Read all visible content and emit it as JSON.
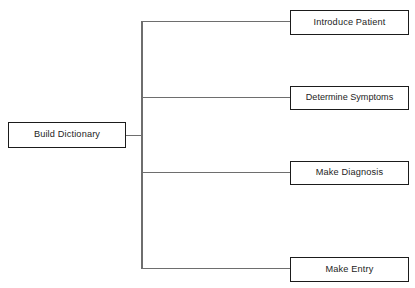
{
  "diagram": {
    "type": "tree",
    "orientation": "left-to-right",
    "background_color": "#ffffff",
    "line_color": "#6e6e6e",
    "border_color": "#1b1b1b",
    "text_color": "#242424",
    "root": {
      "label": "Build Dictionary"
    },
    "branches": [
      {
        "label": "Introduce Patient"
      },
      {
        "label": "Determine Symptoms"
      },
      {
        "label": "Make Diagnosis"
      },
      {
        "label": "Make Entry"
      }
    ]
  }
}
